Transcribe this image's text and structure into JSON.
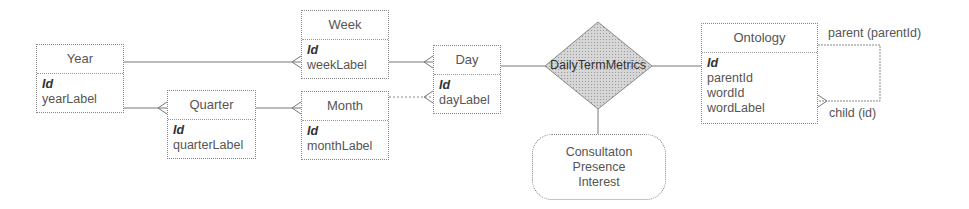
{
  "entities": {
    "year": {
      "title": "Year",
      "key": "Id",
      "fields": [
        "yearLabel"
      ]
    },
    "week": {
      "title": "Week",
      "key": "Id",
      "fields": [
        "weekLabel"
      ]
    },
    "quarter": {
      "title": "Quarter",
      "key": "Id",
      "fields": [
        "quarterLabel"
      ]
    },
    "month": {
      "title": "Month",
      "key": "Id",
      "fields": [
        "monthLabel"
      ]
    },
    "day": {
      "title": "Day",
      "key": "Id",
      "fields": [
        "dayLabel"
      ]
    },
    "ontology": {
      "title": "Ontology",
      "key": "Id",
      "fields": [
        "parentId",
        "wordId",
        "wordLabel"
      ]
    }
  },
  "relationship": {
    "name": "DailyTermMetrics"
  },
  "measures": {
    "lines": [
      "Consultaton",
      "Presence",
      "Interest"
    ]
  },
  "self_relation": {
    "parent_label": "parent (parentId)",
    "child_label": "child (id)"
  },
  "colors": {
    "line": "#777777",
    "diamond_fill": "#c8c8c8",
    "border": "#888888"
  }
}
